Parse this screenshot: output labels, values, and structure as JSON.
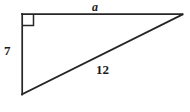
{
  "figure": {
    "kind": "right-triangle",
    "background_color": "#ffffff",
    "stroke_color": "#262626",
    "text_color": "#1a1a1a",
    "stroke_width": 1.6,
    "canvas": {
      "width": 190,
      "height": 112
    }
  },
  "vertices": {
    "top_left": {
      "x": 22,
      "y": 14,
      "name": "right-angle-vertex"
    },
    "top_right": {
      "x": 182,
      "y": 14,
      "name": "apex-vertex"
    },
    "bottom_left": {
      "x": 22,
      "y": 94,
      "name": "base-vertex"
    }
  },
  "edges": [
    {
      "id": "top-edge",
      "name": "horizontal-leg",
      "from": "top_left",
      "to": "top_right",
      "label": "a",
      "label_style": "bold-italic"
    },
    {
      "id": "left-edge",
      "name": "vertical-leg",
      "from": "top_left",
      "to": "bottom_left",
      "label": "7",
      "label_style": "bold"
    },
    {
      "id": "hypotenuse-edge",
      "name": "hypotenuse",
      "from": "bottom_left",
      "to": "top_right",
      "label": "12",
      "label_style": "bold"
    }
  ],
  "right_angle_marker": {
    "name": "right-angle-square",
    "at_vertex": "top_left",
    "size": 11,
    "symbol": "∟"
  },
  "labels": {
    "horizontal_leg": "a",
    "vertical_leg": "7",
    "hypotenuse": "12"
  }
}
